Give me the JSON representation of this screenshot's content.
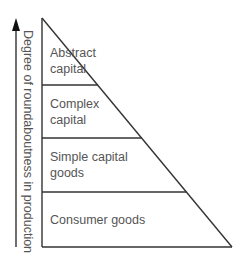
{
  "diagram": {
    "type": "pyramid",
    "axis": {
      "label": "Degree of roundaboutness in production",
      "direction": "up"
    },
    "levels": [
      {
        "lines": [
          "Abstract",
          "capital"
        ]
      },
      {
        "lines": [
          "Complex",
          "capital"
        ]
      },
      {
        "lines": [
          "Simple capital",
          "goods"
        ]
      },
      {
        "lines": [
          "Consumer goods"
        ]
      }
    ],
    "colors": {
      "line": "#333333",
      "text": "#555555"
    }
  }
}
